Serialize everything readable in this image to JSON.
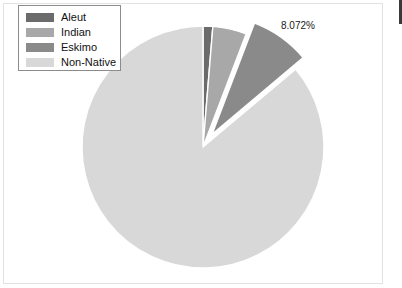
{
  "chart_data": {
    "type": "pie",
    "title": "",
    "categories": [
      "Aleut",
      "Indian",
      "Eskimo",
      "Non-Native"
    ],
    "values": [
      1.3,
      4.5,
      8.072,
      86.128
    ],
    "value_unit": "percent",
    "labels_shown": [
      "",
      "",
      "8.072%",
      ""
    ],
    "exploded": [
      "Eskimo"
    ],
    "start_angle_deg": 0,
    "direction": "clockwise",
    "legend_position": "top-left",
    "grid": false,
    "slice_colors": [
      "#6b6b6b",
      "#a8a8a8",
      "#8a8a8a",
      "#d8d8d8"
    ],
    "separator_color": "#ffffff",
    "annotations": [
      {
        "text": "8.072%",
        "target": "Eskimo"
      }
    ]
  },
  "legend": {
    "items": [
      {
        "label": "Aleut",
        "color": "#6b6b6b"
      },
      {
        "label": "Indian",
        "color": "#a8a8a8"
      },
      {
        "label": "Eskimo",
        "color": "#8a8a8a"
      },
      {
        "label": "Non-Native",
        "color": "#d8d8d8"
      }
    ]
  },
  "callout": {
    "percent_text": "8.072%"
  },
  "geometry": {
    "center_x": 203,
    "center_y": 147,
    "radius": 121
  }
}
